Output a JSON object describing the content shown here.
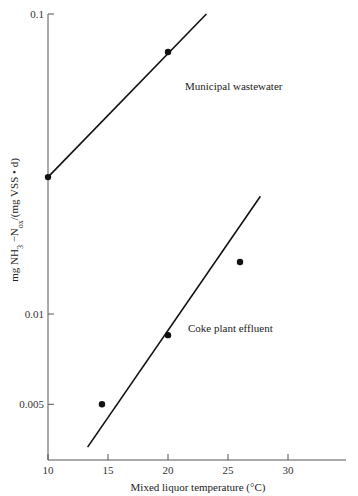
{
  "chart_data": {
    "type": "scatter",
    "title": "",
    "xlabel": "Mixed liquor temperature (°C)",
    "ylabel": "mg NH3−Nox/(mg VSS • d)",
    "ylabel_parts": {
      "pre": "mg NH",
      "sub1": "3",
      "mid": " −N",
      "sub2": "ox",
      "post": "/(mg VSS • d)"
    },
    "xlim": [
      10,
      35
    ],
    "ylim": [
      0.0035,
      0.1
    ],
    "yscale": "log",
    "grid": false,
    "legend": "inline labels",
    "x_ticks": [
      "10",
      "15",
      "20",
      "25",
      "30"
    ],
    "y_ticks": [
      "0.1",
      "0.01",
      "0.005"
    ],
    "series": [
      {
        "name": "Municipal wastewater",
        "points": [
          {
            "x": 10,
            "y": 0.0286
          },
          {
            "x": 20,
            "y": 0.0747
          }
        ],
        "fit_line": [
          {
            "x": 10,
            "y": 0.0286
          },
          {
            "x": 23.2,
            "y": 0.1
          }
        ]
      },
      {
        "name": "Coke plant effluent",
        "points": [
          {
            "x": 14.5,
            "y": 0.005
          },
          {
            "x": 20,
            "y": 0.0085
          },
          {
            "x": 26,
            "y": 0.0149
          }
        ],
        "fit_line": [
          {
            "x": 13.3,
            "y": 0.0036
          },
          {
            "x": 27.7,
            "y": 0.0247
          }
        ]
      }
    ]
  }
}
